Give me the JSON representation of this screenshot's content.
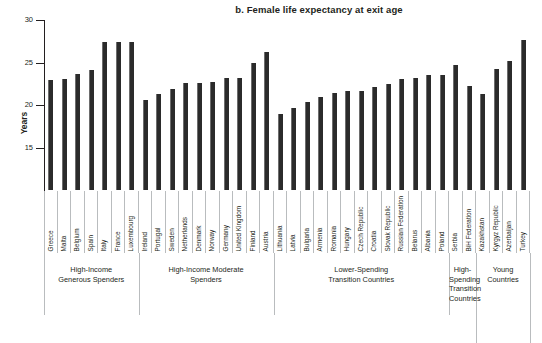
{
  "chart_data": {
    "type": "bar",
    "title": "b. Female life expectancy at exit age",
    "xlabel": "",
    "ylabel": "Years",
    "ylim": [
      10,
      30
    ],
    "yticks": [
      15,
      20,
      25,
      30
    ],
    "grid": false,
    "legend": null,
    "bar_color": "#2b2b2b",
    "categories": [
      "Greece",
      "Malta",
      "Belgium",
      "Spain",
      "Italy",
      "France",
      "Luxembourg",
      "Ireland",
      "Portugal",
      "Sweden",
      "Netherlands",
      "Denmark",
      "Norway",
      "Germany",
      "United Kingdom",
      "Finland",
      "Austria",
      "Lithuania",
      "Latvia",
      "Bulgaria",
      "Armenia",
      "Romania",
      "Hungary",
      "Czech Republic",
      "Croatia",
      "Slovak Republic",
      "Russian Federation",
      "Belarus",
      "Albania",
      "Poland",
      "Serbia",
      "BiH Federation",
      "Kazakhstan",
      "Kyrgyz Republic",
      "Azerbaijan",
      "Turkey"
    ],
    "values": [
      22.9,
      23.1,
      23.6,
      24.1,
      27.4,
      27.4,
      27.4,
      20.6,
      21.3,
      21.9,
      22.6,
      22.6,
      22.7,
      23.2,
      23.2,
      24.9,
      26.2,
      18.9,
      19.7,
      20.3,
      21.0,
      21.4,
      21.6,
      21.7,
      22.1,
      22.5,
      23.1,
      23.2,
      23.5,
      23.5,
      24.7,
      22.2,
      21.3,
      24.2,
      25.2,
      27.7
    ],
    "groups": [
      {
        "label": "High-Income\nGenerous Spenders",
        "start": 0,
        "count": 7
      },
      {
        "label": "High-Income Moderate\nSpenders",
        "start": 7,
        "count": 10
      },
      {
        "label": "Lower-Spending\nTransition Countries",
        "start": 17,
        "count": 13
      },
      {
        "label": "High-\nSpending\nTransition\nCountries",
        "start": 30,
        "count": 2
      },
      {
        "label": "Young\nCountries",
        "start": 32,
        "count": 4
      }
    ]
  }
}
